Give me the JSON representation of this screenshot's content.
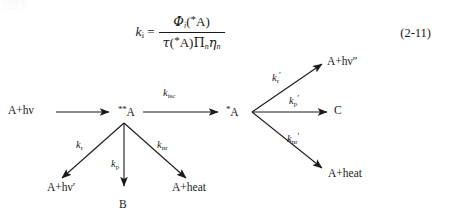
{
  "equation": {
    "label": "k",
    "label_sub": "i",
    "equals": "=",
    "numerator": {
      "symbol": "Φ",
      "symbol_sub": "i",
      "open": "(",
      "star": "*",
      "species": "A",
      "close": ")"
    },
    "denominator": {
      "symbol": "τ",
      "open": "(",
      "star": "*",
      "species": "A",
      "close": ")",
      "product": "Π",
      "product_sub": "n",
      "eta": "η",
      "eta_sub": "n"
    },
    "number": "(2-11)"
  },
  "scheme": {
    "nodes": {
      "ground_excitation": "A+hν",
      "upper_excited": "A",
      "upper_excited_stars": "**",
      "lower_excited": "A",
      "lower_excited_stars": "*",
      "fluorescence_left": "A+hν′",
      "product_b": "B",
      "heat_left": "A+heat",
      "emission_right": "A+hν″",
      "product_c": "C",
      "heat_right": "A+heat"
    },
    "rates": {
      "isc": {
        "k": "k",
        "sub": "isc",
        "prime": ""
      },
      "r": {
        "k": "k",
        "sub": "r",
        "prime": ""
      },
      "p": {
        "k": "k",
        "sub": "p",
        "prime": ""
      },
      "nr": {
        "k": "k",
        "sub": "nr",
        "prime": ""
      },
      "r_prime": {
        "k": "k",
        "sub": "r",
        "prime": "′"
      },
      "p_prime": {
        "k": "k",
        "sub": "p",
        "prime": "′"
      },
      "nr_prime": {
        "k": "k",
        "sub": "nr",
        "prime": "′"
      }
    }
  },
  "colors": {
    "ink": "#1a1a1a",
    "paper": "#ffffff"
  },
  "artifact": {
    "text": "░░░  ░"
  }
}
